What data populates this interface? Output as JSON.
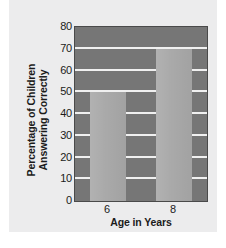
{
  "chart_data": {
    "type": "bar",
    "title": "",
    "subtitle": "",
    "categories": [
      "6",
      "8"
    ],
    "values": [
      50,
      70
    ],
    "series": [
      {
        "name": "Percentage of Children Answering Correctly",
        "values": [
          50,
          70
        ]
      }
    ],
    "xlabel": "Age in Years",
    "ylabel": "Percentage of Children Answering Correctly",
    "ylabel_lines": [
      "Percentage of Children",
      "Answering Correctly"
    ],
    "ylim": [
      0,
      80
    ],
    "yticks": [
      0,
      10,
      20,
      30,
      40,
      50,
      60,
      70,
      80
    ],
    "ytick_labels": [
      "0",
      "10",
      "20",
      "30",
      "40",
      "50",
      "60",
      "70",
      "80"
    ],
    "xtick_labels": [
      "6",
      "8"
    ],
    "grid": true,
    "grid_axis": "y",
    "legend": false,
    "legend_position": "none",
    "annotations": []
  },
  "style": {
    "page_background": "#ffffff",
    "card_background": "#ececed",
    "plot_background": "#767676",
    "plot_border": "#4a4a4a",
    "bar_color": "#a9a9a9",
    "gridline_color": "#f0f0f0",
    "text_color": "#1b1b1b"
  }
}
